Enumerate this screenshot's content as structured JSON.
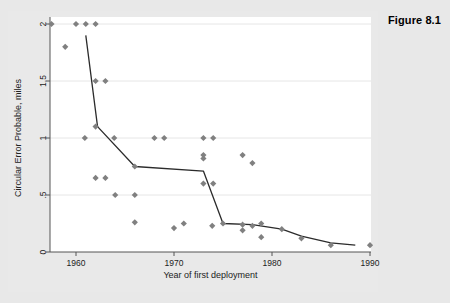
{
  "figure": {
    "title": "Figure 8.1"
  },
  "chart_data": {
    "type": "scatter",
    "title": "Figure 8.1",
    "xlabel": "Year of first deployment",
    "ylabel": "Circular Error Probable, miles",
    "xlim": [
      1957,
      1991
    ],
    "ylim": [
      0,
      2.05
    ],
    "xticks": [
      1960,
      1970,
      1980,
      1990
    ],
    "xticklabels": [
      "1960",
      "1970",
      "1980",
      "1990"
    ],
    "yticks": [
      0,
      0.5,
      1,
      1.5,
      2
    ],
    "yticklabels": [
      "0",
      ".5",
      "1",
      "1.5",
      "2"
    ],
    "grid": "horizontal",
    "legend": "none",
    "marker": "diamond",
    "marker_color": "#808080",
    "line_color": "#2b2b2b",
    "background_color": "#e8e8e8",
    "plot_background_color": "#ffffff",
    "gridline_color": "#e0e0e0",
    "series": [
      {
        "name": "Missile CEP observations",
        "type": "scatter",
        "points": [
          [
            1957.5,
            2.0
          ],
          [
            1960.0,
            2.0
          ],
          [
            1961.0,
            2.0
          ],
          [
            1962.0,
            2.0
          ],
          [
            1958.9,
            1.8
          ],
          [
            1962.0,
            1.5
          ],
          [
            1963.0,
            1.5
          ],
          [
            1960.9,
            1.0
          ],
          [
            1962.0,
            1.1
          ],
          [
            1963.9,
            1.0
          ],
          [
            1968.0,
            1.0
          ],
          [
            1969.0,
            1.0
          ],
          [
            1973.0,
            1.0
          ],
          [
            1974.0,
            1.0
          ],
          [
            1973.0,
            0.85
          ],
          [
            1973.0,
            0.82
          ],
          [
            1977.0,
            0.85
          ],
          [
            1978.0,
            0.78
          ],
          [
            1966.0,
            0.75
          ],
          [
            1962.0,
            0.65
          ],
          [
            1963.0,
            0.65
          ],
          [
            1973.0,
            0.6
          ],
          [
            1974.0,
            0.6
          ],
          [
            1964.0,
            0.5
          ],
          [
            1966.0,
            0.5
          ],
          [
            1966.0,
            0.26
          ],
          [
            1970.0,
            0.21
          ],
          [
            1971.0,
            0.25
          ],
          [
            1973.9,
            0.23
          ],
          [
            1975.0,
            0.25
          ],
          [
            1977.0,
            0.24
          ],
          [
            1977.0,
            0.19
          ],
          [
            1978.0,
            0.23
          ],
          [
            1978.9,
            0.25
          ],
          [
            1978.9,
            0.13
          ],
          [
            1981.0,
            0.2
          ],
          [
            1983.0,
            0.12
          ],
          [
            1986.0,
            0.06
          ],
          [
            1990.0,
            0.06
          ]
        ]
      },
      {
        "name": "Trend line",
        "type": "line",
        "points": [
          [
            1961.0,
            1.9
          ],
          [
            1962.2,
            1.1
          ],
          [
            1966.0,
            0.75
          ],
          [
            1973.0,
            0.71
          ],
          [
            1975.0,
            0.25
          ],
          [
            1978.0,
            0.24
          ],
          [
            1981.0,
            0.2
          ],
          [
            1983.0,
            0.14
          ],
          [
            1986.0,
            0.08
          ],
          [
            1988.5,
            0.06
          ]
        ]
      }
    ]
  }
}
